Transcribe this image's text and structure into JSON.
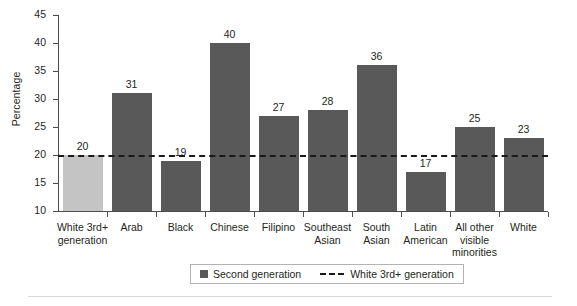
{
  "chart_data": {
    "type": "bar",
    "title": "",
    "xlabel": "",
    "ylabel": "Percentage",
    "ylim": [
      10,
      45
    ],
    "ytick_step": 5,
    "yticks": [
      45,
      40,
      35,
      30,
      25,
      20,
      15,
      10
    ],
    "grid": false,
    "categories": [
      "White 3rd+ generation",
      "Arab",
      "Black",
      "Chinese",
      "Filipino",
      "Southeast Asian",
      "South Asian",
      "Latin American",
      "All other visible minorities",
      "White"
    ],
    "category_lines": [
      [
        "White 3rd+",
        "generation"
      ],
      [
        "Arab"
      ],
      [
        "Black"
      ],
      [
        "Chinese"
      ],
      [
        "Filipino"
      ],
      [
        "Southeast",
        "Asian"
      ],
      [
        "South",
        "Asian"
      ],
      [
        "Latin",
        "American"
      ],
      [
        "All other",
        "visible",
        "minorities"
      ],
      [
        "White"
      ]
    ],
    "values": [
      20,
      31,
      19,
      40,
      27,
      28,
      36,
      17,
      25,
      23
    ],
    "value_labels": [
      "20",
      "31",
      "19",
      "40",
      "27",
      "28",
      "36",
      "17",
      "25",
      "23"
    ],
    "bar_colors": [
      "#c4c4c4",
      "#595959",
      "#595959",
      "#595959",
      "#595959",
      "#595959",
      "#595959",
      "#595959",
      "#595959",
      "#595959"
    ],
    "reference_line": {
      "value": 20,
      "label": "White 3rd+ generation",
      "style": "dashed",
      "color": "#1a1a1a"
    },
    "legend": {
      "position": "bottom-center",
      "entries": [
        {
          "label": "Second generation",
          "marker": "square",
          "color": "#595959"
        },
        {
          "label": "White 3rd+ generation",
          "marker": "dashed-line",
          "color": "#1a1a1a"
        }
      ]
    }
  }
}
